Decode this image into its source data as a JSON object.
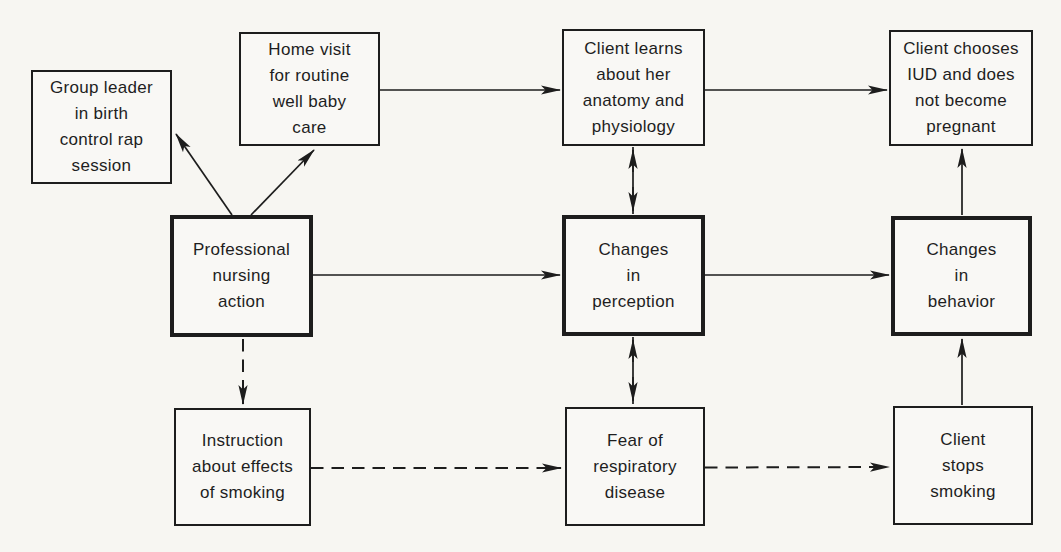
{
  "figure": {
    "kind": "flowchart",
    "ink_color": "#1d1d1d",
    "background_color": "#f7f6f2"
  },
  "boxes": [
    {
      "id": "group-leader",
      "label": "Group leader\nin birth\ncontrol rap\nsession",
      "emphasis": false
    },
    {
      "id": "home-visit",
      "label": "Home visit\nfor routine\nwell baby\ncare",
      "emphasis": false
    },
    {
      "id": "client-learns",
      "label": "Client learns\nabout her\nanatomy and\nphysiology",
      "emphasis": false
    },
    {
      "id": "client-chooses-iud",
      "label": "Client chooses\nIUD and does\nnot become\npregnant",
      "emphasis": false
    },
    {
      "id": "professional-nursing-action",
      "label": "Professional\nnursing\naction",
      "emphasis": true
    },
    {
      "id": "changes-in-perception",
      "label": "Changes\nin\nperception",
      "emphasis": true
    },
    {
      "id": "changes-in-behavior",
      "label": "Changes\nin\nbehavior",
      "emphasis": true
    },
    {
      "id": "instruction-smoking",
      "label": "Instruction\nabout effects\nof smoking",
      "emphasis": false
    },
    {
      "id": "fear-respiratory",
      "label": "Fear of\nrespiratory\ndisease",
      "emphasis": false
    },
    {
      "id": "client-stops-smoking",
      "label": "Client\nstops\nsmoking",
      "emphasis": false
    }
  ],
  "connections": [
    {
      "from": "professional-nursing-action",
      "to": "group-leader",
      "style": "solid",
      "direction": "one-way"
    },
    {
      "from": "professional-nursing-action",
      "to": "home-visit",
      "style": "solid",
      "direction": "one-way"
    },
    {
      "from": "home-visit",
      "to": "client-learns",
      "style": "solid",
      "direction": "one-way"
    },
    {
      "from": "client-learns",
      "to": "client-chooses-iud",
      "style": "solid",
      "direction": "one-way"
    },
    {
      "from": "professional-nursing-action",
      "to": "changes-in-perception",
      "style": "solid",
      "direction": "one-way"
    },
    {
      "from": "changes-in-perception",
      "to": "changes-in-behavior",
      "style": "solid",
      "direction": "one-way"
    },
    {
      "from": "client-learns",
      "to": "changes-in-perception",
      "style": "solid",
      "direction": "two-way"
    },
    {
      "from": "changes-in-perception",
      "to": "fear-respiratory",
      "style": "solid",
      "direction": "two-way"
    },
    {
      "from": "changes-in-behavior",
      "to": "client-chooses-iud",
      "style": "solid",
      "direction": "one-way"
    },
    {
      "from": "client-stops-smoking",
      "to": "changes-in-behavior",
      "style": "solid",
      "direction": "one-way"
    },
    {
      "from": "professional-nursing-action",
      "to": "instruction-smoking",
      "style": "dashed",
      "direction": "one-way"
    },
    {
      "from": "instruction-smoking",
      "to": "fear-respiratory",
      "style": "dashed",
      "direction": "one-way"
    },
    {
      "from": "fear-respiratory",
      "to": "client-stops-smoking",
      "style": "dashed",
      "direction": "one-way"
    }
  ]
}
